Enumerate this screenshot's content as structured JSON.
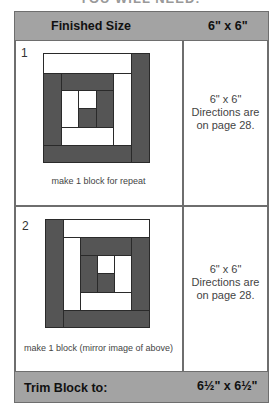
{
  "cut_title": "YOU WILL NEED:",
  "header": {
    "label": "Finished Size",
    "value": "6\" x 6\""
  },
  "rows": [
    {
      "number": "1",
      "caption": "make 1 block for repeat",
      "size": "6\" x 6\"",
      "directions_line1": "Directions are",
      "directions_line2": "on page 28."
    },
    {
      "number": "2",
      "caption": "make 1 block (mirror image of above)",
      "size": "6\" x 6\"",
      "directions_line1": "Directions are",
      "directions_line2": "on page 28."
    }
  ],
  "footer": {
    "label": "Trim Block to:",
    "value": "6½\" x 6½\""
  },
  "colors": {
    "header_bg": "#a3a3a3",
    "border": "#6e6e6e",
    "dark_fabric": "#555555",
    "light_fabric": "#ffffff"
  }
}
